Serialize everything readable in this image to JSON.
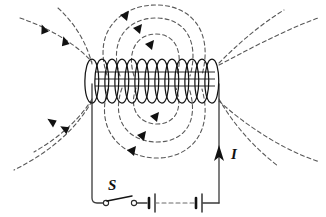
{
  "figure": {
    "type": "physics-diagram",
    "width": 326,
    "height": 217,
    "background_color": "#ffffff",
    "stroke_color": "#1a1a1a",
    "fieldline_color": "#555555",
    "labels": {
      "current": "I",
      "switch": "S"
    },
    "solenoid": {
      "name": "solenoid-coil",
      "turns": 13,
      "left_x": 92,
      "right_x": 219,
      "center_y": 81,
      "loop_half_width": 6.5,
      "loop_half_height": 22
    },
    "circuit": {
      "left_wire_x": 92,
      "right_wire_x": 219,
      "bottom_y": 203,
      "coil_y": 81,
      "switch": {
        "name": "switch-S",
        "state": "open",
        "terminal_left_x": 104,
        "terminal_right_x": 134,
        "y": 203
      },
      "battery_cells": [
        {
          "x": 149,
          "long_plate": true
        },
        {
          "x": 196,
          "long_plate": true
        }
      ],
      "current_arrow": {
        "x": 219,
        "y": 155,
        "direction": "up"
      }
    },
    "field_lines": {
      "inner_loops_above": 3,
      "inner_loops_below": 3,
      "outer_lines_left": 2,
      "outer_lines_right": 2,
      "dash_pattern": "4,3",
      "arrowhead_count": 9
    }
  }
}
